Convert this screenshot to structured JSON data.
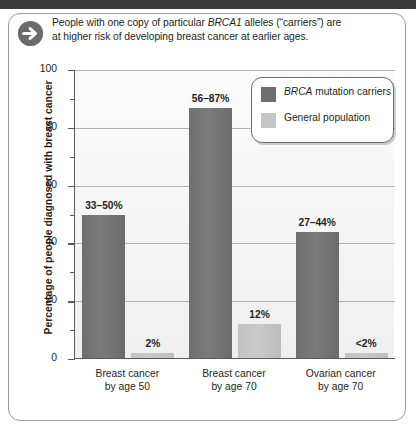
{
  "callout": {
    "icon": "arrow-right-circle-icon",
    "line1_pre": "People with one copy of particular ",
    "line1_italic": "BRCA1",
    "line1_post": " alleles (“carriers”) are",
    "line2": "at higher risk of developing breast cancer at earlier ages."
  },
  "legend": {
    "items": [
      {
        "label_italic": "BRCA",
        "label_rest": " mutation carriers",
        "color": "#6f6f6f",
        "swatch": "dark"
      },
      {
        "label_italic": "",
        "label_rest": "General population",
        "color": "#c6c6c6",
        "swatch": "light"
      }
    ]
  },
  "axes": {
    "ylabel": "Percentage of people diagnosed with breast cancer",
    "yticks": [
      "0",
      "20",
      "40",
      "60",
      "80",
      "100"
    ],
    "yminor": [
      10,
      30,
      50,
      70,
      90
    ]
  },
  "chart_data": {
    "type": "bar",
    "title": "",
    "subtitle": "",
    "xlabel": "",
    "ylabel": "Percentage of people diagnosed with breast cancer",
    "ylim": [
      0,
      100
    ],
    "yticks": [
      0,
      20,
      40,
      60,
      80,
      100
    ],
    "grid": true,
    "legend_position": "top-right",
    "categories": [
      "Breast cancer by age 50",
      "Breast cancer by age 70",
      "Ovarian cancer by age 70"
    ],
    "category_lines": [
      [
        "Breast cancer",
        "by age 50"
      ],
      [
        "Breast cancer",
        "by age 70"
      ],
      [
        "Ovarian cancer",
        "by age 70"
      ]
    ],
    "series": [
      {
        "name": "BRCA mutation carriers",
        "color": "#6f6f6f",
        "values": [
          50,
          87,
          44
        ],
        "range_low": [
          33,
          56,
          27
        ],
        "range_high": [
          50,
          87,
          44
        ],
        "data_labels": [
          "33–50%",
          "56–87%",
          "27–44%"
        ]
      },
      {
        "name": "General population",
        "color": "#c6c6c6",
        "values": [
          2,
          12,
          2
        ],
        "data_labels": [
          "2%",
          "12%",
          "<2%"
        ]
      }
    ]
  }
}
